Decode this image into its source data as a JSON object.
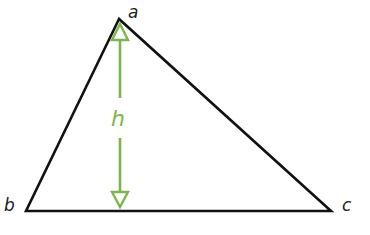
{
  "diagram": {
    "type": "triangle-with-altitude",
    "vertices": {
      "a": {
        "label": "a",
        "x": 119,
        "y": 19
      },
      "b": {
        "label": "b",
        "x": 26,
        "y": 211
      },
      "c": {
        "label": "c",
        "x": 331,
        "y": 211
      }
    },
    "altitude": {
      "label": "h",
      "color": "#7ab648",
      "x": 120,
      "top": 23,
      "bottom": 209
    },
    "colors": {
      "triangle": "#111111",
      "altitude": "#7ab648",
      "vertex_label": "#222222"
    }
  }
}
